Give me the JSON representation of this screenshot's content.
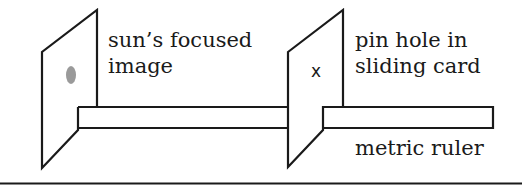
{
  "diagram": {
    "labels": {
      "image_card_line1": "sun’s focused",
      "image_card_line2": "image",
      "pinhole_card_line1": "pin hole in",
      "pinhole_card_line2": "sliding card",
      "ruler": "metric ruler",
      "pinhole_mark": "x"
    },
    "colors": {
      "stroke": "#1a1a1a",
      "sun_image_spot": "#9a9a9a",
      "background": "#ffffff"
    }
  }
}
